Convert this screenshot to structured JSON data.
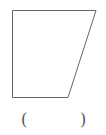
{
  "figure": {
    "shape": "right-trapezoid",
    "stroke_color": "#666666",
    "stroke_width": 1,
    "vertices": [
      [
        12.5,
        10.5
      ],
      [
        96,
        10.5
      ],
      [
        68,
        97.5
      ],
      [
        12.5,
        97.5
      ]
    ]
  },
  "answer_blank": {
    "open": "(",
    "close": ")",
    "value": ""
  }
}
